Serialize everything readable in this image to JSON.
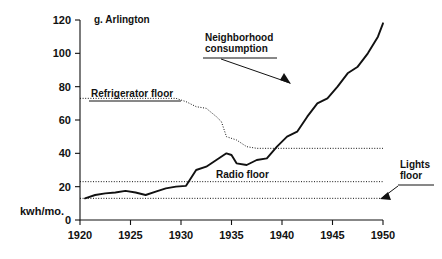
{
  "figure": {
    "panel_title": "g. Arlington",
    "y_axis_caption": "kwh/mo.",
    "background": "#ffffff",
    "ink": "#111111"
  },
  "annotations": [
    {
      "id": "neighborhood-consumption",
      "line1": "Neighborhood",
      "line2": "consumption"
    },
    {
      "id": "refrigerator-floor",
      "line1": "Refrigerator floor",
      "line2": ""
    },
    {
      "id": "radio-floor",
      "line1": "Radio floor",
      "line2": ""
    },
    {
      "id": "lights-floor",
      "line1": "Lights",
      "line2": "floor"
    }
  ],
  "chart_data": {
    "type": "line",
    "title": "g. Arlington",
    "xlabel": "",
    "ylabel": "kwh/mo.",
    "xlim": [
      1920,
      1950
    ],
    "ylim": [
      0,
      120
    ],
    "xticks": [
      1920,
      1925,
      1930,
      1935,
      1940,
      1945,
      1950
    ],
    "xtick_labels": [
      "1920",
      "1925",
      "1930",
      "1935",
      "1940",
      "1945",
      "1950"
    ],
    "yticks": [
      0,
      20,
      40,
      60,
      80,
      100,
      120
    ],
    "ytick_labels": [
      "0",
      "20",
      "40",
      "60",
      "80",
      "100",
      "120"
    ],
    "grid": false,
    "legend": "none",
    "series": [
      {
        "name": "Neighborhood consumption",
        "style": "solid",
        "x": [
          1920.5,
          1921.5,
          1922.5,
          1923.5,
          1924.5,
          1925.5,
          1926.5,
          1927.5,
          1928.5,
          1929.5,
          1930.5,
          1931.5,
          1932.5,
          1933.5,
          1934.5,
          1935.0,
          1935.5,
          1936.5,
          1937.5,
          1938.5,
          1939.5,
          1940.5,
          1941.5,
          1942.5,
          1943.5,
          1944.5,
          1945.5,
          1946.5,
          1947.5,
          1948.5,
          1949.5,
          1950.0
        ],
        "values": [
          13,
          15,
          16,
          16.5,
          17.5,
          16.5,
          15,
          17,
          19,
          20,
          20.5,
          30,
          32,
          36,
          40,
          39,
          34,
          33,
          36,
          37,
          44,
          50,
          53,
          62,
          70,
          73,
          80,
          88,
          92,
          100,
          110,
          118
        ]
      },
      {
        "name": "Refrigerator floor",
        "style": "dotted",
        "x": [
          1920.0,
          1929.5,
          1930.5,
          1931.5,
          1932.5,
          1933.5,
          1934.0,
          1934.5,
          1935.5,
          1936.5,
          1937.5,
          1950.0
        ],
        "values": [
          73,
          73,
          71,
          68,
          67,
          62,
          59,
          50,
          48,
          44,
          43,
          43
        ]
      },
      {
        "name": "Radio floor",
        "style": "dotted",
        "x": [
          1920.0,
          1950.0
        ],
        "values": [
          23,
          23
        ]
      },
      {
        "name": "Lights floor",
        "style": "dotted",
        "x": [
          1920.0,
          1950.0
        ],
        "values": [
          13,
          13
        ]
      }
    ]
  }
}
